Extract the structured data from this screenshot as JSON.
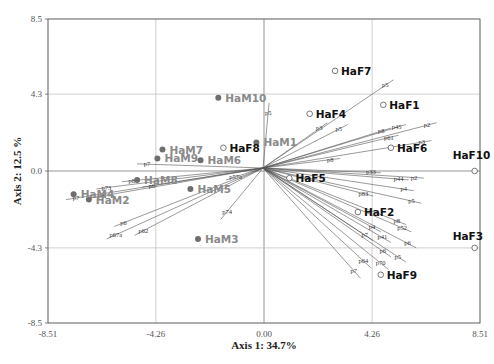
{
  "chart_data": {
    "type": "scatter",
    "subtype": "biplot",
    "title": "",
    "xlabel": "Axis 1: 34.7%",
    "ylabel": "Axis 2: 12.5 %",
    "xlim": [
      -8.51,
      8.51
    ],
    "ylim": [
      -8.5,
      8.5
    ],
    "x_ticks": [
      "-8.51",
      "-4.26",
      "0.00",
      "4.26",
      "8.51"
    ],
    "y_ticks": [
      "8.5",
      "4.3",
      "0.0",
      "-4.3",
      "-8.5"
    ],
    "grid": true,
    "colors": {
      "ham": "#6e6e6e",
      "ham_label": "#8a8a8a",
      "haf": "#111111",
      "vector": "#555555",
      "grid": "#bbbbbb",
      "frame": "#666666"
    },
    "series": [
      {
        "name": "HaM",
        "marker": "filled-circle",
        "points": [
          {
            "label": "HaM1",
            "x": -0.3,
            "y": 1.6
          },
          {
            "label": "HaM2",
            "x": -6.9,
            "y": -1.6
          },
          {
            "label": "HaM3",
            "x": -2.6,
            "y": -3.8
          },
          {
            "label": "HaM4",
            "x": -7.5,
            "y": -1.3
          },
          {
            "label": "HaM5",
            "x": -2.9,
            "y": -1.0
          },
          {
            "label": "HaM6",
            "x": -2.5,
            "y": 0.6
          },
          {
            "label": "HaM7",
            "x": -4.0,
            "y": 1.2
          },
          {
            "label": "HaM8",
            "x": -5.0,
            "y": -0.5
          },
          {
            "label": "HaM9",
            "x": -4.2,
            "y": 0.7
          },
          {
            "label": "HaM10",
            "x": -1.8,
            "y": 4.1
          }
        ]
      },
      {
        "name": "HaF",
        "marker": "open-circle",
        "points": [
          {
            "label": "HaF1",
            "x": 4.7,
            "y": 3.7
          },
          {
            "label": "HaF2",
            "x": 3.7,
            "y": -2.3
          },
          {
            "label": "HaF3",
            "x": 8.3,
            "y": -4.3
          },
          {
            "label": "HaF4",
            "x": 1.8,
            "y": 3.2
          },
          {
            "label": "HaF5",
            "x": 1.0,
            "y": -0.4
          },
          {
            "label": "HaF6",
            "x": 5.0,
            "y": 1.3
          },
          {
            "label": "HaF7",
            "x": 2.8,
            "y": 5.6
          },
          {
            "label": "HaF8",
            "x": -1.6,
            "y": 1.3
          },
          {
            "label": "HaF9",
            "x": 4.6,
            "y": -5.8
          },
          {
            "label": "HaF10",
            "x": 8.3,
            "y": 0.0
          }
        ]
      }
    ],
    "vectors": [
      {
        "label": "p7",
        "x": -5.0,
        "y": 0.4
      },
      {
        "label": "p7",
        "x": -7.8,
        "y": -1.6
      },
      {
        "label": "p73",
        "x": -6.6,
        "y": -1.0
      },
      {
        "label": "p8",
        "x": -6.8,
        "y": -1.5
      },
      {
        "label": "p8",
        "x": -5.6,
        "y": -0.6
      },
      {
        "label": "p6",
        "x": -4.8,
        "y": -0.9
      },
      {
        "label": "p6",
        "x": -5.9,
        "y": -3.1
      },
      {
        "label": "p62",
        "x": -5.1,
        "y": -3.6
      },
      {
        "label": "p67a",
        "x": -6.2,
        "y": -3.8
      },
      {
        "label": "p57a",
        "x": -1.5,
        "y": -0.5
      },
      {
        "label": "p74",
        "x": -1.7,
        "y": -2.7
      },
      {
        "label": "p5",
        "x": 0.2,
        "y": 3.8
      },
      {
        "label": "p3",
        "x": 2.5,
        "y": 2.7
      },
      {
        "label": "p5",
        "x": 5.1,
        "y": 5.1
      },
      {
        "label": "p5",
        "x": 3.3,
        "y": 2.6
      },
      {
        "label": "p8",
        "x": 5.0,
        "y": 2.4
      },
      {
        "label": "p45",
        "x": 5.6,
        "y": 2.6
      },
      {
        "label": "p2",
        "x": 6.8,
        "y": 2.7
      },
      {
        "label": "p3",
        "x": 6.6,
        "y": 1.7
      },
      {
        "label": "p61",
        "x": 5.3,
        "y": 2.0
      },
      {
        "label": "p8",
        "x": 3.0,
        "y": 0.7
      },
      {
        "label": "p33",
        "x": 4.6,
        "y": -0.1
      },
      {
        "label": "p2",
        "x": 6.3,
        "y": -0.4
      },
      {
        "label": "p44",
        "x": 5.7,
        "y": -0.5
      },
      {
        "label": "p4",
        "x": 5.9,
        "y": -1.1
      },
      {
        "label": "p83",
        "x": 4.3,
        "y": -1.4
      },
      {
        "label": "p5",
        "x": 6.2,
        "y": -1.8
      },
      {
        "label": "p8",
        "x": 5.6,
        "y": -3.0
      },
      {
        "label": "p52",
        "x": 5.8,
        "y": -3.4
      },
      {
        "label": "p4",
        "x": 4.6,
        "y": -3.4
      },
      {
        "label": "p7",
        "x": 4.3,
        "y": -3.9
      },
      {
        "label": "p41",
        "x": 5.0,
        "y": -4.0
      },
      {
        "label": "p6",
        "x": 6.0,
        "y": -4.3
      },
      {
        "label": "p6",
        "x": 5.0,
        "y": -4.8
      },
      {
        "label": "p5",
        "x": 5.6,
        "y": -5.1
      },
      {
        "label": "p64",
        "x": 4.2,
        "y": -5.4
      },
      {
        "label": "p70",
        "x": 4.9,
        "y": -5.5
      },
      {
        "label": "p7",
        "x": 3.8,
        "y": -6.0
      }
    ]
  }
}
